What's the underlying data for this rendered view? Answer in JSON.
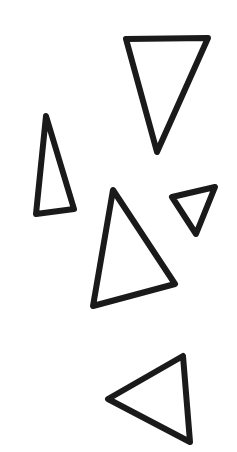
{
  "canvas": {
    "width": 237,
    "height": 452,
    "background": "#ffffff"
  },
  "style": {
    "stroke_color": "#1a1a1a",
    "stroke_width": 6
  },
  "shapes": [
    {
      "id": "triangle-1",
      "kind": "triangle",
      "orientation": "pointing-down",
      "points": [
        [
          126,
          39
        ],
        [
          208,
          38
        ],
        [
          157,
          152
        ]
      ]
    },
    {
      "id": "triangle-2",
      "kind": "triangle",
      "orientation": "tall-narrow-pointing-up",
      "points": [
        [
          46,
          116
        ],
        [
          74,
          209
        ],
        [
          36,
          214
        ]
      ]
    },
    {
      "id": "triangle-3",
      "kind": "triangle",
      "orientation": "pointing-up",
      "points": [
        [
          113,
          190
        ],
        [
          175,
          284
        ],
        [
          93,
          306
        ]
      ]
    },
    {
      "id": "triangle-4",
      "kind": "triangle",
      "orientation": "small-pointing-down",
      "points": [
        [
          172,
          197
        ],
        [
          215,
          187
        ],
        [
          196,
          234
        ]
      ]
    },
    {
      "id": "triangle-5",
      "kind": "triangle",
      "orientation": "pointing-left",
      "points": [
        [
          108,
          399
        ],
        [
          183,
          356
        ],
        [
          190,
          442
        ]
      ]
    }
  ]
}
